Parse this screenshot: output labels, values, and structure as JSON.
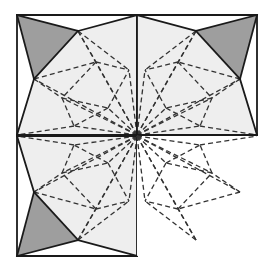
{
  "figure": {
    "width": 268,
    "height": 277,
    "background_color": "#ffffff"
  },
  "colors": {
    "background": "#ffffff",
    "fill_dark_gray": "#9e9e9e",
    "fill_light_gray": "#eeeeee",
    "fill_white": "#ffffff",
    "stroke_solid": "#1a1a1a",
    "stroke_dashed": "#333333"
  },
  "geometry": {
    "outer_frame": {
      "x": 17,
      "y": 15,
      "width": 240,
      "height": 242
    },
    "center_point": {
      "x": 137,
      "y": 136
    },
    "midline_x": 137,
    "midline_y": 136,
    "tile_size": 120
  },
  "style": {
    "solid_stroke_width": 1.8,
    "dashed_stroke_width": 1.3,
    "dash_pattern": "5,3.2"
  },
  "quadrants": [
    {
      "id": "top-left",
      "name": "quadrant-top-left",
      "origin": {
        "x": 17,
        "y": 15
      },
      "transform": "none",
      "has_solid_edges": true,
      "dark_region_corner": "top-left",
      "light_region_fill": "#eeeeee",
      "dark_region_fill": "#9e9e9e"
    },
    {
      "id": "top-right",
      "name": "quadrant-top-right",
      "origin": {
        "x": 137,
        "y": 15
      },
      "transform": "mirror-horizontal",
      "has_solid_edges": true,
      "dark_region_corner": "top-right",
      "light_region_fill": "#eeeeee",
      "dark_region_fill": "#9e9e9e"
    },
    {
      "id": "bottom-left",
      "name": "quadrant-bottom-left",
      "origin": {
        "x": 17,
        "y": 136
      },
      "transform": "mirror-vertical",
      "has_solid_edges": true,
      "dark_region_corner": "bottom-left",
      "light_region_fill": "#eeeeee",
      "dark_region_fill": "#9e9e9e"
    },
    {
      "id": "bottom-right",
      "name": "quadrant-bottom-right",
      "origin": {
        "x": 137,
        "y": 136
      },
      "transform": "rotate-180",
      "has_solid_edges": false,
      "dark_region_corner": "none",
      "light_region_fill": "#ffffff",
      "dark_region_fill": "#ffffff"
    }
  ],
  "tile_template": {
    "description": "Unit triangulation on a 120x120 square. Corner of square is at (0,0); center-of-figure corner is at (120,120).",
    "vertices": {
      "corner_outer": [
        0,
        0
      ],
      "corner_top_right": [
        120,
        0
      ],
      "corner_bottom_left": [
        0,
        120
      ],
      "hub": [
        120,
        120
      ],
      "top_edge_node": [
        61,
        16
      ],
      "left_edge_node": [
        17,
        64
      ],
      "inner_a": [
        79,
        47
      ],
      "inner_b": [
        45,
        83
      ],
      "inner_c": [
        91,
        93
      ],
      "bottom_edge_node": [
        57,
        111
      ],
      "right_edge_node": [
        112,
        55
      ]
    },
    "solid_edges": [
      [
        [
          0,
          0
        ],
        [
          120,
          0
        ]
      ],
      [
        [
          0,
          0
        ],
        [
          0,
          120
        ]
      ],
      [
        [
          0,
          0
        ],
        [
          61,
          16
        ]
      ],
      [
        [
          0,
          0
        ],
        [
          17,
          64
        ]
      ],
      [
        [
          61,
          16
        ],
        [
          17,
          64
        ]
      ],
      [
        [
          61,
          16
        ],
        [
          120,
          0
        ]
      ],
      [
        [
          17,
          64
        ],
        [
          0,
          120
        ]
      ],
      [
        [
          0,
          120
        ],
        [
          120,
          120
        ]
      ],
      [
        [
          120,
          0
        ],
        [
          120,
          120
        ]
      ]
    ],
    "dashed_edges": [
      [
        [
          120,
          120
        ],
        [
          61,
          16
        ]
      ],
      [
        [
          120,
          120
        ],
        [
          17,
          64
        ]
      ],
      [
        [
          120,
          120
        ],
        [
          79,
          47
        ]
      ],
      [
        [
          120,
          120
        ],
        [
          45,
          83
        ]
      ],
      [
        [
          120,
          120
        ],
        [
          91,
          93
        ]
      ],
      [
        [
          120,
          120
        ],
        [
          57,
          111
        ]
      ],
      [
        [
          120,
          120
        ],
        [
          112,
          55
        ]
      ],
      [
        [
          61,
          16
        ],
        [
          79,
          47
        ]
      ],
      [
        [
          61,
          16
        ],
        [
          112,
          55
        ]
      ],
      [
        [
          79,
          47
        ],
        [
          112,
          55
        ]
      ],
      [
        [
          79,
          47
        ],
        [
          45,
          83
        ]
      ],
      [
        [
          17,
          64
        ],
        [
          45,
          83
        ]
      ],
      [
        [
          45,
          83
        ],
        [
          57,
          111
        ]
      ],
      [
        [
          45,
          83
        ],
        [
          91,
          93
        ]
      ],
      [
        [
          91,
          93
        ],
        [
          57,
          111
        ]
      ],
      [
        [
          91,
          93
        ],
        [
          112,
          55
        ]
      ],
      [
        [
          57,
          111
        ],
        [
          0,
          120
        ]
      ],
      [
        [
          17,
          64
        ],
        [
          79,
          47
        ]
      ]
    ],
    "dark_polygon": [
      [
        0,
        0
      ],
      [
        61,
        16
      ],
      [
        17,
        64
      ]
    ],
    "light_polygon": [
      [
        61,
        16
      ],
      [
        120,
        0
      ],
      [
        120,
        120
      ],
      [
        0,
        120
      ],
      [
        17,
        64
      ]
    ]
  },
  "labels": {
    "none_visible": ""
  }
}
